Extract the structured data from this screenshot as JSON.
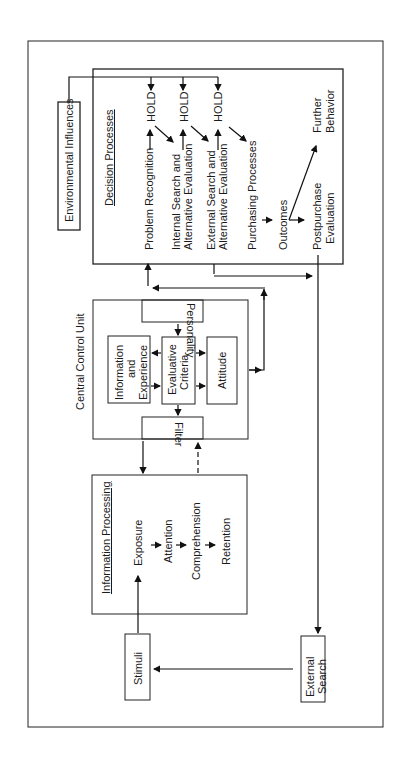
{
  "diagram": {
    "environmental_influences": "Environmental Influences",
    "decision_processes": {
      "title": "Decision Processes",
      "steps": [
        "Problem Recognition",
        "Internal Search and",
        "Alternative Evaluation",
        "External Search and",
        "Alternative Evaluation",
        "Purchasing Processes",
        "Outcomes",
        "Postpurchase",
        "Evaluation"
      ],
      "hold": "HOLD",
      "further_1": "Further",
      "further_2": "Behavior"
    },
    "central_control_unit": {
      "title": "Central Control Unit",
      "personality": "Personality",
      "filter": "Filter",
      "info_exp": [
        "Information",
        "and",
        "Experience"
      ],
      "evaluative": [
        "Evaluative",
        "Criteria"
      ],
      "attitude": "Attitude"
    },
    "information_processing": {
      "title": "Information Processing",
      "steps": [
        "Exposure",
        "Attention",
        "Comprehension",
        "Retention"
      ]
    },
    "stimuli": "Stimuli",
    "external_search": [
      "External",
      "Search"
    ]
  }
}
